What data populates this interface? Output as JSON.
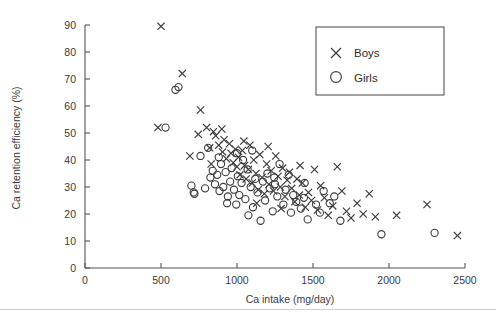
{
  "figure": {
    "background_color": "#ffffff",
    "axis_color": "#555555",
    "marker_color": "#3b3b3b",
    "rule_color": "#cfcfcf"
  },
  "chart_data": {
    "type": "scatter",
    "title": "",
    "xlabel": "Ca intake (mg/day)",
    "ylabel": "Ca retention efficiency (%)",
    "xlim": [
      0,
      2500
    ],
    "ylim": [
      0,
      90
    ],
    "xticks": [
      0,
      500,
      1000,
      1500,
      2000,
      2500
    ],
    "yticks": [
      0,
      10,
      20,
      30,
      40,
      50,
      60,
      70,
      80,
      90
    ],
    "xtick_labels": [
      "0",
      "500",
      "1000",
      "1500",
      "2000",
      "2500"
    ],
    "ytick_labels": [
      "0",
      "10",
      "20",
      "30",
      "40",
      "50",
      "60",
      "70",
      "80",
      "90"
    ],
    "grid": false,
    "legend_position": "top-right",
    "series": [
      {
        "name": "Boys",
        "marker": "x",
        "color": "#3b3b3b",
        "points": [
          [
            500,
            89.5
          ],
          [
            480,
            52.0
          ],
          [
            640,
            72.0
          ],
          [
            760,
            58.5
          ],
          [
            690,
            41.5
          ],
          [
            745,
            49.5
          ],
          [
            800,
            52.0
          ],
          [
            820,
            44.5
          ],
          [
            845,
            50.5
          ],
          [
            860,
            49.0
          ],
          [
            880,
            45.5
          ],
          [
            900,
            51.5
          ],
          [
            905,
            43.0
          ],
          [
            930,
            40.5
          ],
          [
            950,
            46.0
          ],
          [
            960,
            42.5
          ],
          [
            975,
            39.0
          ],
          [
            990,
            44.0
          ],
          [
            1000,
            37.5
          ],
          [
            1010,
            41.0
          ],
          [
            1020,
            34.5
          ],
          [
            1035,
            43.5
          ],
          [
            1050,
            38.0
          ],
          [
            1060,
            33.0
          ],
          [
            1075,
            36.5
          ],
          [
            1085,
            45.5
          ],
          [
            1100,
            31.5
          ],
          [
            1110,
            40.0
          ],
          [
            1125,
            35.0
          ],
          [
            1140,
            29.0
          ],
          [
            1150,
            42.0
          ],
          [
            1165,
            33.5
          ],
          [
            1180,
            27.5
          ],
          [
            1195,
            38.5
          ],
          [
            1210,
            31.0
          ],
          [
            1225,
            36.0
          ],
          [
            1240,
            28.5
          ],
          [
            1255,
            41.5
          ],
          [
            1270,
            34.0
          ],
          [
            1285,
            30.0
          ],
          [
            1300,
            37.0
          ],
          [
            1315,
            26.5
          ],
          [
            1330,
            32.5
          ],
          [
            1345,
            35.5
          ],
          [
            1360,
            29.5
          ],
          [
            1380,
            24.5
          ],
          [
            1395,
            33.0
          ],
          [
            1410,
            27.0
          ],
          [
            1430,
            31.5
          ],
          [
            1450,
            22.5
          ],
          [
            1470,
            28.0
          ],
          [
            1490,
            25.0
          ],
          [
            1510,
            36.5
          ],
          [
            1530,
            21.5
          ],
          [
            1550,
            30.5
          ],
          [
            1575,
            26.0
          ],
          [
            1600,
            19.5
          ],
          [
            1630,
            23.0
          ],
          [
            1660,
            37.5
          ],
          [
            1690,
            28.5
          ],
          [
            1720,
            21.0
          ],
          [
            1750,
            18.5
          ],
          [
            1790,
            24.0
          ],
          [
            1830,
            20.0
          ],
          [
            1870,
            27.5
          ],
          [
            1910,
            19.0
          ],
          [
            2050,
            19.5
          ],
          [
            2250,
            23.5
          ],
          [
            2450,
            12.0
          ],
          [
            830,
            38.5
          ],
          [
            915,
            47.5
          ],
          [
            1045,
            47.0
          ],
          [
            1130,
            24.0
          ],
          [
            1290,
            22.0
          ],
          [
            1415,
            38.0
          ],
          [
            1205,
            45.0
          ]
        ]
      },
      {
        "name": "Girls",
        "marker": "o",
        "color": "#3b3b3b",
        "points": [
          [
            530,
            52.0
          ],
          [
            595,
            66.0
          ],
          [
            615,
            67.0
          ],
          [
            700,
            30.5
          ],
          [
            715,
            28.0
          ],
          [
            720,
            27.5
          ],
          [
            760,
            41.5
          ],
          [
            790,
            29.5
          ],
          [
            810,
            44.5
          ],
          [
            825,
            33.5
          ],
          [
            840,
            36.0
          ],
          [
            855,
            31.0
          ],
          [
            870,
            34.5
          ],
          [
            885,
            28.5
          ],
          [
            895,
            38.5
          ],
          [
            910,
            30.0
          ],
          [
            925,
            35.5
          ],
          [
            940,
            26.5
          ],
          [
            955,
            32.0
          ],
          [
            965,
            37.0
          ],
          [
            980,
            29.0
          ],
          [
            995,
            23.5
          ],
          [
            1005,
            34.0
          ],
          [
            1015,
            27.0
          ],
          [
            1030,
            31.5
          ],
          [
            1040,
            40.0
          ],
          [
            1055,
            25.5
          ],
          [
            1070,
            36.5
          ],
          [
            1090,
            30.0
          ],
          [
            1105,
            22.5
          ],
          [
            1120,
            33.0
          ],
          [
            1135,
            28.0
          ],
          [
            1155,
            17.5
          ],
          [
            1170,
            32.0
          ],
          [
            1185,
            25.0
          ],
          [
            1200,
            35.0
          ],
          [
            1215,
            29.5
          ],
          [
            1235,
            21.0
          ],
          [
            1250,
            31.0
          ],
          [
            1265,
            26.5
          ],
          [
            1280,
            38.5
          ],
          [
            1305,
            23.5
          ],
          [
            1320,
            29.0
          ],
          [
            1340,
            34.5
          ],
          [
            1355,
            20.5
          ],
          [
            1370,
            27.0
          ],
          [
            1390,
            24.5
          ],
          [
            1420,
            22.0
          ],
          [
            1440,
            26.0
          ],
          [
            1465,
            18.0
          ],
          [
            1520,
            23.5
          ],
          [
            1545,
            20.5
          ],
          [
            1570,
            28.5
          ],
          [
            1610,
            24.0
          ],
          [
            1640,
            26.5
          ],
          [
            1680,
            17.5
          ],
          [
            1950,
            12.5
          ],
          [
            2300,
            13.0
          ],
          [
            880,
            41.0
          ],
          [
            1000,
            42.5
          ],
          [
            1100,
            43.5
          ],
          [
            1245,
            33.5
          ],
          [
            1075,
            19.5
          ],
          [
            935,
            24.0
          ],
          [
            1445,
            31.5
          ]
        ]
      }
    ]
  },
  "legend": {
    "entries": [
      {
        "label": "Boys",
        "marker": "x"
      },
      {
        "label": "Girls",
        "marker": "o"
      }
    ]
  }
}
